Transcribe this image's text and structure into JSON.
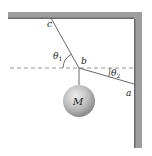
{
  "figure": {
    "type": "physics-statics",
    "labels": {
      "c": "c",
      "b": "b",
      "a": "a",
      "mass": "M",
      "theta1": "θ",
      "theta1_sub": "1",
      "theta2": "θ",
      "theta2_sub": "2"
    },
    "colors": {
      "wall": "#9a9a9a",
      "wall_edge": "#5e5e5e",
      "string": "#555555",
      "dashed": "#8a8a8a",
      "ball_light": "#e6e6e6",
      "ball_dark": "#8e8e8e"
    }
  }
}
